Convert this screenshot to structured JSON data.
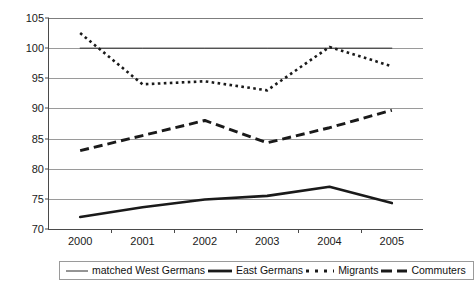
{
  "chart_data": {
    "type": "line",
    "title": "",
    "subtitle": "",
    "xlabel": "",
    "ylabel": "",
    "categories": [
      "2000",
      "2001",
      "2002",
      "2003",
      "2004",
      "2005"
    ],
    "ylim": [
      70,
      105
    ],
    "ytick_values": [
      70,
      75,
      80,
      85,
      90,
      95,
      100,
      105
    ],
    "ytick_labels": [
      "70",
      "75",
      "80",
      "85",
      "90",
      "95",
      "100",
      "105"
    ],
    "grid": true,
    "legend_position": "bottom",
    "series": [
      {
        "name": "matched West Germans",
        "style": "thin-solid",
        "color": "#2b2b2b",
        "values": [
          100,
          100,
          100,
          100,
          100,
          100
        ]
      },
      {
        "name": "East Germans",
        "style": "thick-solid",
        "color": "#1a1a1a",
        "values": [
          72.0,
          73.6,
          74.9,
          75.5,
          77.0,
          74.3
        ]
      },
      {
        "name": "Migrants",
        "style": "dotted",
        "color": "#1a1a1a",
        "values": [
          102.5,
          94.0,
          94.5,
          93.0,
          100.2,
          97.0
        ]
      },
      {
        "name": "Commuters",
        "style": "dashed",
        "color": "#1a1a1a",
        "values": [
          83.0,
          85.5,
          88.0,
          84.3,
          86.8,
          89.7
        ]
      }
    ]
  },
  "legend": {
    "items": [
      {
        "label": "matched West Germans",
        "swatch": "thin-solid-swatch"
      },
      {
        "label": "East Germans",
        "swatch": "thick-solid-swatch"
      },
      {
        "label": "Migrants",
        "swatch": "dotted-swatch"
      },
      {
        "label": "Commuters",
        "swatch": "dashed-swatch"
      }
    ]
  }
}
